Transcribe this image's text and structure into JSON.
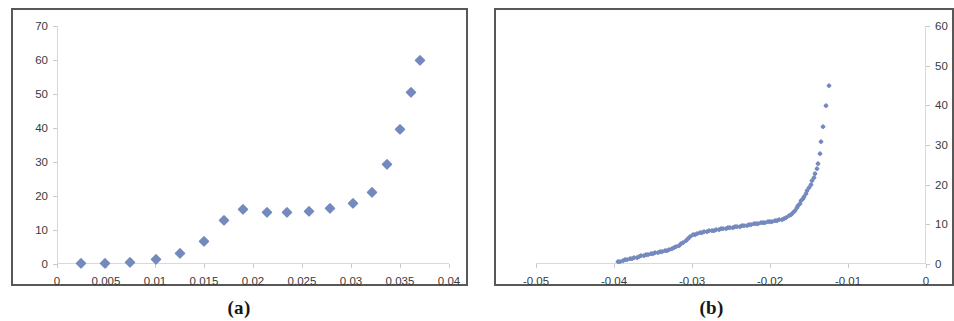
{
  "figure": {
    "panels": [
      {
        "caption": "(a)",
        "axis": {
          "x_ticks": [
            "0",
            "0.005",
            "0.01",
            "0.015",
            "0.02",
            "0.025",
            "0.03",
            "0.035",
            "0.04"
          ],
          "y_ticks": [
            "0",
            "10",
            "20",
            "30",
            "40",
            "50",
            "60",
            "70"
          ],
          "y_label_side": "left"
        }
      },
      {
        "caption": "(b)",
        "axis": {
          "x_ticks": [
            "-0.05",
            "-0.04",
            "-0.03",
            "-0.02",
            "-0.01",
            "0"
          ],
          "y_ticks": [
            "0",
            "10",
            "20",
            "30",
            "40",
            "50",
            "60"
          ],
          "y_label_side": "right"
        }
      }
    ]
  },
  "colors": {
    "marker": "#7489be",
    "frame": "#585858",
    "axis": "#d9d9d9",
    "tick_text": "#3a3a3a",
    "background": "#ffffff"
  },
  "chart_data": [
    {
      "type": "scatter",
      "title": "(a)",
      "xlabel": "",
      "ylabel": "",
      "xlim": [
        0,
        0.04
      ],
      "ylim": [
        0,
        70
      ],
      "xticks": [
        0,
        0.005,
        0.01,
        0.015,
        0.02,
        0.025,
        0.03,
        0.035,
        0.04
      ],
      "yticks": [
        0,
        10,
        20,
        30,
        40,
        50,
        60,
        70
      ],
      "grid": false,
      "legend": "none",
      "marker": "diamond",
      "series": [
        {
          "name": "series-a",
          "x": [
            0.0024,
            0.0049,
            0.0074,
            0.0101,
            0.0126,
            0.015,
            0.017,
            0.019,
            0.0214,
            0.0235,
            0.0257,
            0.0279,
            0.0302,
            0.0321,
            0.0337,
            0.035,
            0.0361,
            0.037
          ],
          "y": [
            0.3,
            0.3,
            0.6,
            1.6,
            3.2,
            6.9,
            13.0,
            16.1,
            15.3,
            15.3,
            15.7,
            16.5,
            18.0,
            21.3,
            29.3,
            39.8,
            50.5,
            60.1
          ]
        }
      ]
    },
    {
      "type": "scatter",
      "title": "(b)",
      "xlabel": "",
      "ylabel": "",
      "xlim": [
        -0.05,
        0
      ],
      "ylim": [
        0,
        60
      ],
      "xticks": [
        -0.05,
        -0.04,
        -0.03,
        -0.02,
        -0.01,
        0
      ],
      "yticks": [
        0,
        10,
        20,
        30,
        40,
        50,
        60
      ],
      "grid": false,
      "legend": "none",
      "marker": "diamond",
      "note": "dense point cloud forming a continuous rising curve with a plateau near y=8-11 between x=-0.030 and x=-0.017, then a steep rise",
      "series": [
        {
          "name": "series-b",
          "x": [
            -0.0395,
            -0.0392,
            -0.0389,
            -0.0386,
            -0.0383,
            -0.038,
            -0.0377,
            -0.0374,
            -0.0371,
            -0.0368,
            -0.0365,
            -0.0362,
            -0.0359,
            -0.0356,
            -0.0353,
            -0.035,
            -0.0347,
            -0.0344,
            -0.0341,
            -0.0338,
            -0.0335,
            -0.0332,
            -0.0329,
            -0.0326,
            -0.0323,
            -0.032,
            -0.0317,
            -0.0314,
            -0.0311,
            -0.0308,
            -0.0305,
            -0.0302,
            -0.0299,
            -0.0296,
            -0.0293,
            -0.029,
            -0.0287,
            -0.0284,
            -0.0281,
            -0.0278,
            -0.0275,
            -0.0272,
            -0.0269,
            -0.0266,
            -0.0263,
            -0.026,
            -0.0257,
            -0.0254,
            -0.0251,
            -0.0248,
            -0.0245,
            -0.0242,
            -0.0239,
            -0.0236,
            -0.0233,
            -0.023,
            -0.0227,
            -0.0224,
            -0.0221,
            -0.0218,
            -0.0215,
            -0.0212,
            -0.0209,
            -0.0206,
            -0.0203,
            -0.02,
            -0.0197,
            -0.0194,
            -0.0191,
            -0.0188,
            -0.0185,
            -0.0182,
            -0.0179,
            -0.0176,
            -0.0173,
            -0.017,
            -0.0168,
            -0.0166,
            -0.0164,
            -0.0162,
            -0.016,
            -0.0158,
            -0.0156,
            -0.0154,
            -0.0152,
            -0.015,
            -0.0148,
            -0.0146,
            -0.0144,
            -0.0142,
            -0.014,
            -0.0138,
            -0.0136,
            -0.0134,
            -0.0132,
            -0.0128,
            -0.0124
          ],
          "y": [
            0.4,
            0.5,
            0.7,
            0.9,
            1.0,
            1.2,
            1.3,
            1.5,
            1.6,
            1.8,
            1.9,
            2.0,
            2.2,
            2.3,
            2.4,
            2.6,
            2.7,
            2.8,
            3.0,
            3.1,
            3.3,
            3.4,
            3.6,
            3.8,
            4.0,
            4.3,
            4.6,
            5.0,
            5.4,
            5.9,
            6.4,
            6.9,
            7.2,
            7.4,
            7.6,
            7.7,
            7.9,
            8.0,
            8.1,
            8.2,
            8.3,
            8.4,
            8.5,
            8.6,
            8.7,
            8.8,
            8.9,
            9.0,
            9.1,
            9.2,
            9.3,
            9.4,
            9.4,
            9.5,
            9.6,
            9.7,
            9.8,
            9.9,
            10.0,
            10.1,
            10.2,
            10.3,
            10.4,
            10.4,
            10.5,
            10.6,
            10.7,
            10.8,
            10.9,
            11.0,
            11.2,
            11.4,
            11.7,
            12.0,
            12.4,
            12.9,
            13.4,
            14.0,
            14.6,
            15.2,
            15.8,
            16.4,
            17.0,
            17.7,
            18.4,
            19.2,
            20.0,
            20.9,
            21.8,
            22.8,
            23.9,
            25.1,
            27.8,
            30.8,
            34.5,
            39.8,
            45.0,
            51.6
          ]
        }
      ]
    }
  ]
}
